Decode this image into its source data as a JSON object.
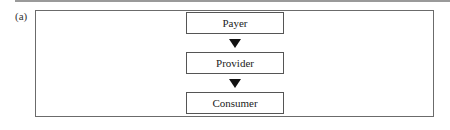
{
  "figure": {
    "panel_label": "(a)",
    "nodes": [
      {
        "id": "payer",
        "label": "Payer"
      },
      {
        "id": "provider",
        "label": "Provider"
      },
      {
        "id": "consumer",
        "label": "Consumer"
      }
    ],
    "edges": [
      {
        "from": "payer",
        "to": "provider",
        "arrow": "down-triangle"
      },
      {
        "from": "provider",
        "to": "consumer",
        "arrow": "down-triangle"
      }
    ],
    "colors": {
      "frame": "#6b6b6b",
      "node_border": "#555555",
      "arrow": "#111111",
      "rule": "#9a9a9a"
    }
  }
}
